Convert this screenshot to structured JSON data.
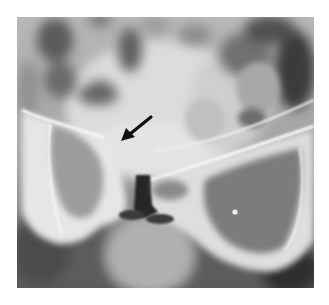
{
  "image": {
    "kind": "radiograph",
    "subject": "pelvis, anteroposterior view",
    "grayscale": true,
    "annotation": {
      "type": "arrow",
      "color": "#111111",
      "tail": [
        151,
        117
      ],
      "tip": [
        121,
        141
      ],
      "points_to": "left superior pubic ramus / pubic symphysis region"
    },
    "colors": {
      "background": "#ffffff",
      "bone_highlight": "#f2f2f2",
      "soft_tissue": "#8c8c8c",
      "dark_gas": "#2a2a2a"
    }
  }
}
